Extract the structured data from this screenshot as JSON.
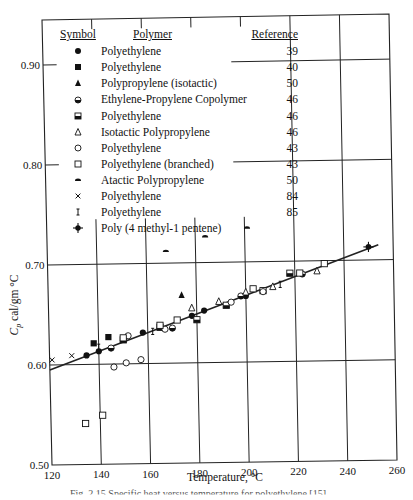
{
  "chart_data": {
    "type": "scatter",
    "title": "",
    "xlabel": "Temperature, °C",
    "ylabel": "Cp cal/gm °C",
    "xlim": [
      120,
      260
    ],
    "ylim": [
      0.5,
      0.95
    ],
    "xticks": [
      120,
      140,
      160,
      180,
      200,
      220,
      240,
      260
    ],
    "yticks": [
      0.5,
      0.6,
      0.7,
      0.8,
      0.9
    ],
    "ytick_labels": [
      "0.50",
      "0.60",
      "0.70",
      "0.80",
      "0.90"
    ],
    "grid": true,
    "legend_position": "upper-left (inside)",
    "legend_headers": {
      "symbol": "Symbol",
      "polymer": "Polymer",
      "reference": "Reference"
    },
    "fit_line": {
      "x": [
        120,
        254
      ],
      "y": [
        0.595,
        0.715
      ]
    },
    "series": [
      {
        "symbol": "filled-circle",
        "name": "Polyethylene",
        "reference": "39",
        "points": [
          [
            135,
            0.609
          ],
          [
            140,
            0.613
          ],
          [
            158,
            0.631
          ],
          [
            178,
            0.647
          ],
          [
            183,
            0.652
          ],
          [
            200,
            0.666
          ]
        ]
      },
      {
        "symbol": "filled-square",
        "name": "Polyethylene",
        "reference": "40",
        "points": [
          [
            138,
            0.621
          ],
          [
            144,
            0.627
          ]
        ]
      },
      {
        "symbol": "filled-triangle",
        "name": "Polypropylene (isotactic)",
        "reference": "50",
        "points": [
          [
            174,
            0.668
          ]
        ]
      },
      {
        "symbol": "half-filled-circle",
        "name": "Ethylene-Propylene Copolymer",
        "reference": "46",
        "points": [
          [
            145,
            0.616
          ],
          [
            170,
            0.635
          ],
          [
            198,
            0.666
          ],
          [
            223,
            0.687
          ]
        ]
      },
      {
        "symbol": "half-filled-square",
        "name": "Polyethylene",
        "reference": "46",
        "points": [
          [
            150,
            0.624
          ],
          [
            165,
            0.636
          ],
          [
            180,
            0.643
          ],
          [
            192,
            0.657
          ],
          [
            207,
            0.671
          ],
          [
            218,
            0.688
          ]
        ]
      },
      {
        "symbol": "open-triangle",
        "name": "Isotactic Polypropylene",
        "reference": "46",
        "points": [
          [
            178,
            0.655
          ],
          [
            189,
            0.661
          ],
          [
            200,
            0.67
          ],
          [
            211,
            0.675
          ],
          [
            229,
            0.69
          ]
        ]
      },
      {
        "symbol": "open-circle",
        "name": "Polyethylene",
        "reference": "43",
        "points": [
          [
            146,
            0.597
          ],
          [
            151,
            0.601
          ],
          [
            157,
            0.604
          ],
          [
            152,
            0.628
          ],
          [
            167,
            0.634
          ],
          [
            194,
            0.66
          ],
          [
            207,
            0.67
          ]
        ]
      },
      {
        "symbol": "open-square",
        "name": "Polyethylene (branched)",
        "reference": "43",
        "points": [
          [
            134,
            0.541
          ],
          [
            141,
            0.549
          ],
          [
            150,
            0.626
          ],
          [
            165,
            0.638
          ],
          [
            172,
            0.643
          ],
          [
            203,
            0.673
          ],
          [
            222,
            0.688
          ],
          [
            232,
            0.697
          ]
        ]
      },
      {
        "symbol": "half-disc",
        "name": "Atactic Polypropylene",
        "reference": "50",
        "points": [
          [
            168,
            0.712
          ],
          [
            184,
            0.726
          ],
          [
            201,
            0.734
          ]
        ]
      },
      {
        "symbol": "cross-x",
        "name": "Polyethylene",
        "reference": "84",
        "points": [
          [
            121,
            0.605
          ],
          [
            129,
            0.609
          ]
        ]
      },
      {
        "symbol": "i-beam",
        "name": "Polyethylene",
        "reference": "85",
        "points": [
          [
            140,
            0.617
          ],
          [
            162,
            0.632
          ],
          [
            214,
            0.677
          ]
        ]
      },
      {
        "symbol": "circle-plus",
        "name": "Poly (4 methyl-1 pentene)",
        "reference": "",
        "points": [
          [
            250,
            0.713
          ]
        ]
      }
    ]
  },
  "axes": {
    "xlabel": "Temperature, °C",
    "ylabel_main": "C",
    "ylabel_sub": "p",
    "ylabel_rest": " cal/gm °C",
    "xtick_labels": [
      "120",
      "140",
      "160",
      "180",
      "200",
      "220",
      "240",
      "260"
    ]
  },
  "legend": {
    "header_symbol": "Symbol",
    "header_polymer": "Polymer",
    "header_reference": "Reference",
    "rows": [
      {
        "symbol": "filled-circle",
        "name": "Polyethylene",
        "reference": "39"
      },
      {
        "symbol": "filled-square",
        "name": "Polyethylene",
        "reference": "40"
      },
      {
        "symbol": "filled-triangle",
        "name": "Polypropylene (isotactic)",
        "reference": "50"
      },
      {
        "symbol": "half-filled-circle",
        "name": "Ethylene-Propylene Copolymer",
        "reference": "46"
      },
      {
        "symbol": "half-filled-square",
        "name": "Polyethylene",
        "reference": "46"
      },
      {
        "symbol": "open-triangle",
        "name": "Isotactic Polypropylene",
        "reference": "46"
      },
      {
        "symbol": "open-circle",
        "name": "Polyethylene",
        "reference": "43"
      },
      {
        "symbol": "open-square",
        "name": "Polyethylene (branched)",
        "reference": "43"
      },
      {
        "symbol": "half-disc",
        "name": "Atactic Polypropylene",
        "reference": "50"
      },
      {
        "symbol": "cross-x",
        "name": "Polyethylene",
        "reference": "84"
      },
      {
        "symbol": "i-beam",
        "name": "Polyethylene",
        "reference": "85"
      },
      {
        "symbol": "circle-plus",
        "name": "Poly (4 methyl-1 pentene)",
        "reference": ""
      }
    ]
  },
  "caption": "Fig. 2.15  Specific heat versus temperature for polyethylene [15]"
}
